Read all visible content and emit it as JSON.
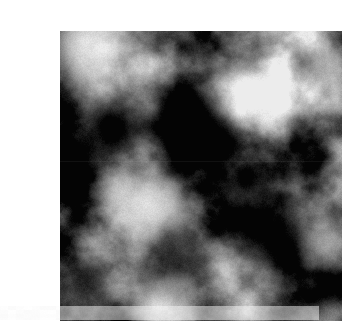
{
  "page": {
    "width": 319,
    "height": 320,
    "background_color": "#ffffff",
    "content_type": "procedural-grayscale-noise-image"
  },
  "figure": {
    "name": "fractal-noise-texture",
    "x": 20,
    "y": 15,
    "width": 282,
    "height": 290,
    "colorspace": "grayscale",
    "base_color": "#6a6a6a",
    "min_luminance": 4,
    "max_luminance": 236,
    "mean_luminance": 104,
    "border_color": "#ffffff",
    "has_visible_border": false
  },
  "noise": {
    "type": "fractal-brownian-motion",
    "octaves": 6,
    "base_frequency": 0.016,
    "lacunarity": 2.0,
    "gain": 0.5,
    "seed": 20250114,
    "contrast": 1.45,
    "brightness_offset": -0.02,
    "grain_amplitude": 13,
    "smoothing": "bicubic"
  },
  "features": [
    {
      "name": "bright-top-left-corner",
      "kind": "light",
      "cx": 26,
      "cy": 12,
      "radius": 72,
      "strength": 0.72,
      "luminance": 232
    },
    {
      "name": "dark-upper-left-crescent",
      "kind": "dark",
      "cx": 52,
      "cy": 96,
      "radius": 46,
      "strength": 0.88,
      "luminance": 14
    },
    {
      "name": "dark-upper-center-diagonal-blob",
      "kind": "dark",
      "cx": 128,
      "cy": 88,
      "radius": 54,
      "strength": 0.95,
      "luminance": 8
    },
    {
      "name": "dark-upper-center-blob-tail",
      "kind": "dark",
      "cx": 158,
      "cy": 110,
      "radius": 34,
      "strength": 0.82,
      "luminance": 16
    },
    {
      "name": "bright-upper-right-disc",
      "kind": "light",
      "cx": 197,
      "cy": 62,
      "radius": 44,
      "strength": 0.78,
      "luminance": 214
    },
    {
      "name": "bright-right-edge-upper",
      "kind": "light",
      "cx": 268,
      "cy": 36,
      "radius": 38,
      "strength": 0.52,
      "luminance": 190
    },
    {
      "name": "dark-left-edge-midband",
      "kind": "dark",
      "cx": 16,
      "cy": 128,
      "radius": 36,
      "strength": 0.72,
      "luminance": 18
    },
    {
      "name": "bright-left-center-cloud",
      "kind": "light",
      "cx": 92,
      "cy": 176,
      "radius": 56,
      "strength": 0.8,
      "luminance": 222
    },
    {
      "name": "bright-left-center-cloud-lobe",
      "kind": "light",
      "cx": 58,
      "cy": 164,
      "radius": 36,
      "strength": 0.58,
      "luminance": 200
    },
    {
      "name": "dark-center-right-patch",
      "kind": "dark",
      "cx": 186,
      "cy": 148,
      "radius": 28,
      "strength": 0.8,
      "luminance": 12
    },
    {
      "name": "dark-lower-right-band",
      "kind": "dark",
      "cx": 214,
      "cy": 206,
      "radius": 62,
      "strength": 0.74,
      "luminance": 26
    },
    {
      "name": "dark-lower-center-band",
      "kind": "dark",
      "cx": 120,
      "cy": 232,
      "radius": 52,
      "strength": 0.58,
      "luminance": 48
    },
    {
      "name": "bright-bottom-center-glow",
      "kind": "light",
      "cx": 100,
      "cy": 276,
      "radius": 46,
      "strength": 0.74,
      "luminance": 228
    },
    {
      "name": "bright-right-edge-lower",
      "kind": "light",
      "cx": 272,
      "cy": 212,
      "radius": 40,
      "strength": 0.62,
      "luminance": 206
    },
    {
      "name": "bright-bottom-right-corner",
      "kind": "light",
      "cx": 258,
      "cy": 288,
      "radius": 34,
      "strength": 0.4,
      "luminance": 170
    },
    {
      "name": "dark-bottom-left-corner",
      "kind": "dark",
      "cx": 24,
      "cy": 252,
      "radius": 40,
      "strength": 0.5,
      "luminance": 52
    }
  ],
  "artifacts": {
    "seam": {
      "name": "horizontal-compression-seam",
      "y": 130,
      "opacity": 0.055
    },
    "margin_speckle": {
      "name": "bottom-margin-compression-speckle",
      "y": 306,
      "height": 14,
      "opacity": 0.5,
      "amplitude": 9
    }
  }
}
